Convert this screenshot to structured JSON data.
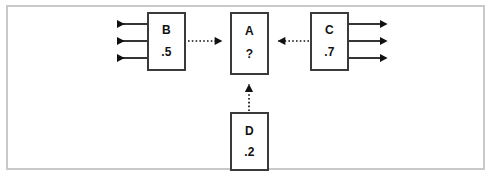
{
  "diagram": {
    "type": "node-link-diagram",
    "title": "",
    "canvas": {
      "width": 493,
      "height": 182,
      "background": "#ffffff"
    },
    "frame": {
      "border_color": "#c9c9c9",
      "border_width": 2
    },
    "node_border_color": "#3a3a3a",
    "edge_color": "#111111",
    "nodes": [
      {
        "id": "B",
        "name": "B",
        "value": ".5",
        "x": 147,
        "y": 12,
        "w": 39,
        "h": 59
      },
      {
        "id": "A",
        "name": "A",
        "value": "?",
        "x": 230,
        "y": 12,
        "w": 39,
        "h": 63
      },
      {
        "id": "C",
        "name": "C",
        "value": ".7",
        "x": 310,
        "y": 12,
        "w": 39,
        "h": 59
      },
      {
        "id": "D",
        "name": "D",
        "value": ".2",
        "x": 230,
        "y": 112,
        "w": 39,
        "h": 59
      }
    ],
    "edges": [
      {
        "id": "b-to-a",
        "from": "B",
        "to": "A",
        "style": "dotted",
        "arrowhead": "to",
        "direction": "right"
      },
      {
        "id": "c-to-a",
        "from": "C",
        "to": "A",
        "style": "dotted",
        "arrowhead": "to",
        "direction": "left"
      },
      {
        "id": "d-to-a",
        "from": "D",
        "to": "A",
        "style": "dotted",
        "arrowhead": "to",
        "direction": "up"
      }
    ],
    "external_arrows": {
      "left_group": {
        "source": "B",
        "count": 3,
        "style": "solid",
        "direction": "left",
        "rows_y": [
          24,
          41,
          58
        ],
        "tip_x": 108,
        "tail_x": 147
      },
      "right_group": {
        "source": "C",
        "count": 3,
        "style": "solid",
        "direction": "right",
        "rows_y": [
          24,
          41,
          58
        ],
        "tail_x": 349,
        "tip_x": 388
      }
    }
  }
}
